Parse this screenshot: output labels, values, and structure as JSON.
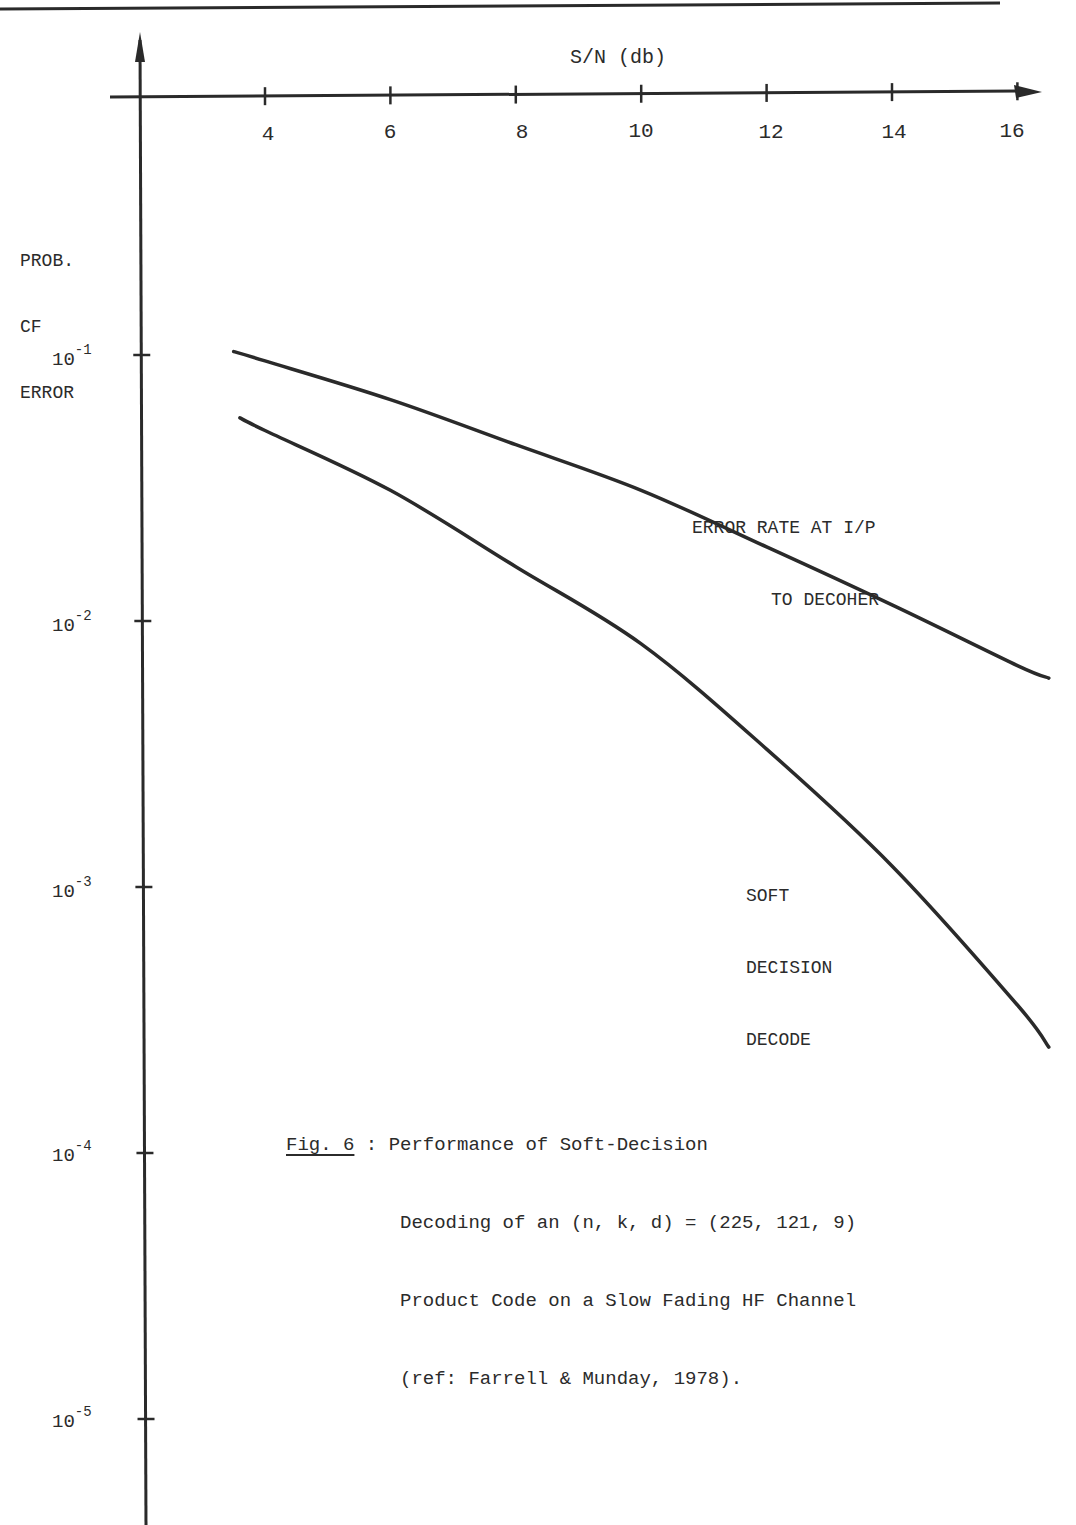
{
  "chart_data": {
    "type": "line",
    "title": "Fig. 6 : Performance of Soft-Decision Decoding of an (n, k, d) = (225, 121, 9) Product Code on a Slow Fading HF Channel (ref: Farrell & Munday, 1978).",
    "xlabel": "S/N (db)",
    "ylabel": "PROB. OF ERROR",
    "x_ticks": [
      4,
      6,
      8,
      10,
      12,
      14,
      16
    ],
    "y_ticks": [
      "10^-1",
      "10^-2",
      "10^-3",
      "10^-4",
      "10^-5"
    ],
    "xlim": [
      2,
      16.5
    ],
    "yscale": "log",
    "ylim": [
      1e-05,
      0.1
    ],
    "grid": false,
    "legend": "inline annotations",
    "series": [
      {
        "name": "ERROR RATE AT I/P TO DECODER",
        "x": [
          3.5,
          4,
          6,
          8,
          10,
          12,
          14,
          16,
          16.5
        ],
        "values": [
          0.103,
          0.095,
          0.068,
          0.046,
          0.031,
          0.019,
          0.0115,
          0.0068,
          0.0061
        ]
      },
      {
        "name": "SOFT DECISION DECODE",
        "x": [
          3.6,
          4,
          6,
          8,
          10,
          12,
          14,
          16,
          16.5
        ],
        "values": [
          0.058,
          0.052,
          0.031,
          0.016,
          0.0082,
          0.0033,
          0.0012,
          0.00036,
          0.00025
        ]
      }
    ]
  },
  "axes": {
    "x_title": "S/N (db)",
    "x_tick_labels": [
      "4",
      "6",
      "8",
      "10",
      "12",
      "14",
      "16"
    ],
    "y_title_lines": [
      "PROB.",
      "CF",
      "ERROR"
    ],
    "y_tick_labels": [
      {
        "base": "10",
        "exp": "-1"
      },
      {
        "base": "10",
        "exp": "-2"
      },
      {
        "base": "10",
        "exp": "-3"
      },
      {
        "base": "10",
        "exp": "-4"
      },
      {
        "base": "10",
        "exp": "-5"
      }
    ]
  },
  "annotations": {
    "upper_curve": [
      "ERROR RATE AT I/P",
      "TO DECOHER"
    ],
    "lower_curve": [
      "SOFT",
      "DECISION",
      "DECODE"
    ]
  },
  "caption": {
    "fig_label": "Fig. 6",
    "separator": " : ",
    "lines": [
      "Performance of Soft-Decision",
      "Decoding of an (n, k, d) = (225, 121, 9)",
      "Product Code on a Slow Fading HF Channel",
      "(ref: Farrell & Munday, 1978)."
    ]
  },
  "colors": {
    "ink": "#2a2a2a",
    "paper": "#ffffff"
  }
}
